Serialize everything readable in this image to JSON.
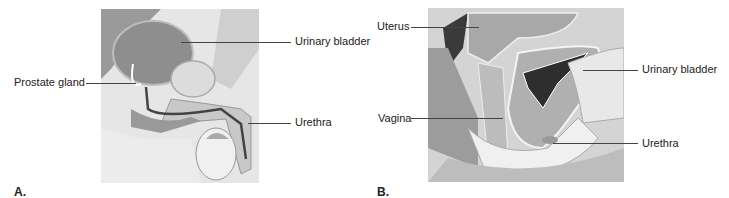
{
  "panel_a": {
    "letter": "A.",
    "labels": {
      "urinary_bladder": "Urinary bladder",
      "prostate_gland": "Prostate gland",
      "urethra": "Urethra"
    }
  },
  "panel_b": {
    "letter": "B.",
    "labels": {
      "uterus": "Uterus",
      "urinary_bladder": "Urinary bladder",
      "vagina": "Vagina",
      "urethra": "Urethra"
    }
  }
}
